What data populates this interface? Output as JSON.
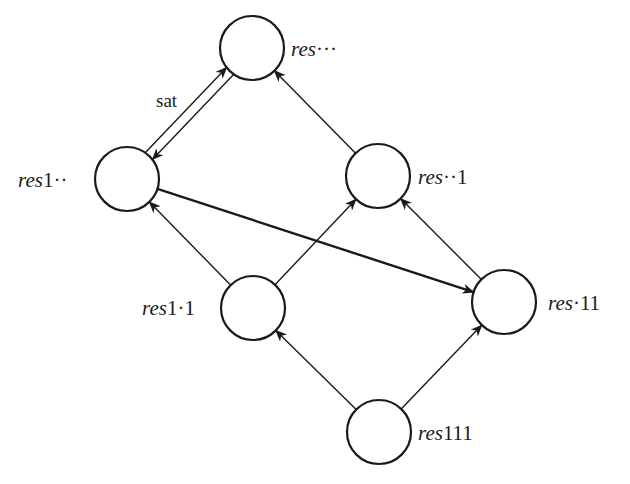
{
  "diagram": {
    "type": "lattice-graph",
    "nodes": [
      {
        "id": "res_all",
        "prefix": "res",
        "suffix": "···",
        "label_side": "right"
      },
      {
        "id": "res1",
        "prefix": "res",
        "suffix": "1··",
        "label_side": "left"
      },
      {
        "id": "res_1",
        "prefix": "res",
        "suffix": "··1",
        "label_side": "right"
      },
      {
        "id": "res11",
        "prefix": "res",
        "suffix": "1·1",
        "label_side": "left"
      },
      {
        "id": "res_11",
        "prefix": "res",
        "suffix": "·11",
        "label_side": "right"
      },
      {
        "id": "res111",
        "prefix": "res",
        "suffix": "111",
        "label_side": "right"
      }
    ],
    "edges": [
      {
        "from": "res_all",
        "to": "res1",
        "label": "sat",
        "style": "normal"
      },
      {
        "from": "res1",
        "to": "res_all",
        "label": "",
        "style": "normal"
      },
      {
        "from": "res_1",
        "to": "res_all",
        "label": "",
        "style": "normal"
      },
      {
        "from": "res11",
        "to": "res1",
        "label": "",
        "style": "normal"
      },
      {
        "from": "res11",
        "to": "res_1",
        "label": "",
        "style": "normal"
      },
      {
        "from": "res_11",
        "to": "res_1",
        "label": "",
        "style": "normal"
      },
      {
        "from": "res1",
        "to": "res_11",
        "label": "",
        "style": "bold"
      },
      {
        "from": "res111",
        "to": "res11",
        "label": "",
        "style": "normal"
      },
      {
        "from": "res111",
        "to": "res_11",
        "label": "",
        "style": "normal"
      }
    ],
    "edge_labels": {
      "sat": "sat"
    }
  }
}
